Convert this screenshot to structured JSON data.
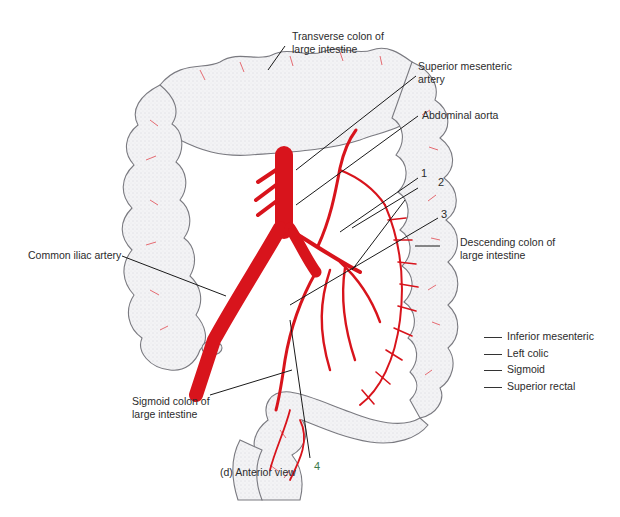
{
  "figure": {
    "caption": "(d) Anterior view",
    "colors": {
      "artery": "#d8141c",
      "vessel_fine": "#e0303a",
      "colon_fill": "#f4f4f6",
      "colon_outline": "#7a7a80",
      "leader_line": "#1a1a1a",
      "number_4": "#3c7a4a"
    },
    "labels": {
      "transverse_colon": [
        "Transverse colon of",
        "large intestine"
      ],
      "superior_mesenteric": [
        "Superior mesenteric",
        "artery"
      ],
      "abdominal_aorta": "Abdominal aorta",
      "descending_colon": [
        "Descending colon of",
        "large intestine"
      ],
      "common_iliac": "Common iliac artery",
      "sigmoid_colon": [
        "Sigmoid colon of",
        "large intestine"
      ]
    },
    "numbers": [
      "1",
      "2",
      "3",
      "4"
    ],
    "answer_key": [
      {
        "label": "Inferior mesenteric"
      },
      {
        "label": "Left colic"
      },
      {
        "label": "Sigmoid"
      },
      {
        "label": "Superior rectal"
      }
    ]
  }
}
